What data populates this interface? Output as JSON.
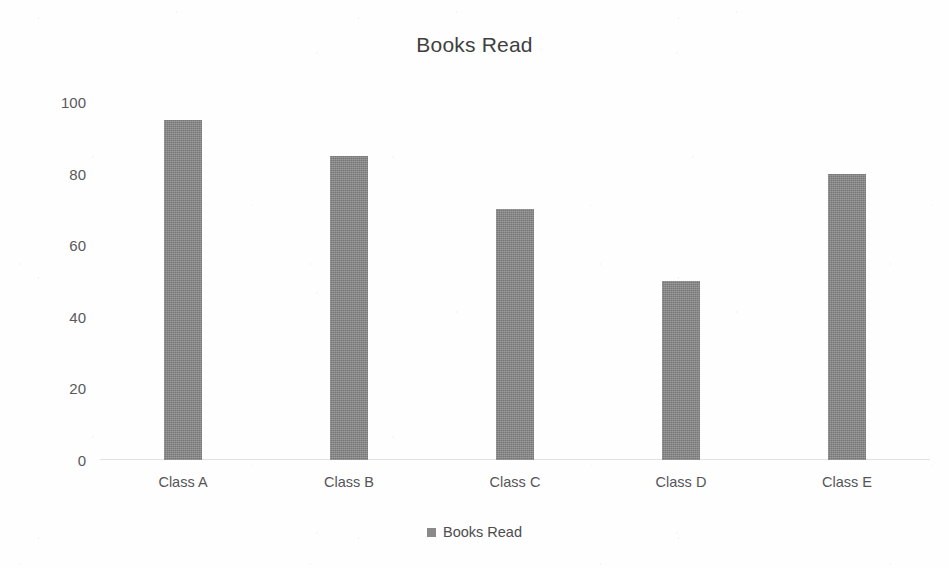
{
  "chart_data": {
    "type": "bar",
    "title": "Books Read",
    "categories": [
      "Class A",
      "Class B",
      "Class C",
      "Class D",
      "Class E"
    ],
    "values": [
      95,
      85,
      70,
      50,
      80
    ],
    "series": [
      {
        "name": "Books Read",
        "values": [
          95,
          85,
          70,
          50,
          80
        ]
      }
    ],
    "xlabel": "",
    "ylabel": "",
    "ylim": [
      0,
      100
    ],
    "yticks": [
      0,
      20,
      40,
      60,
      80,
      100
    ],
    "ytick_labels": [
      "0",
      "20",
      "40",
      "60",
      "80",
      "100"
    ],
    "grid": false,
    "legend": {
      "position": "bottom",
      "entries": [
        "Books Read"
      ]
    },
    "colors": {
      "bar": "#868686",
      "legend_swatch": "#8a8a8a",
      "title_text": "#3f3f3f",
      "tick_text": "#59595b",
      "background": "#fefefe"
    }
  },
  "legend": {
    "swatch_icon": "square-marker-icon",
    "label": "Books Read"
  }
}
